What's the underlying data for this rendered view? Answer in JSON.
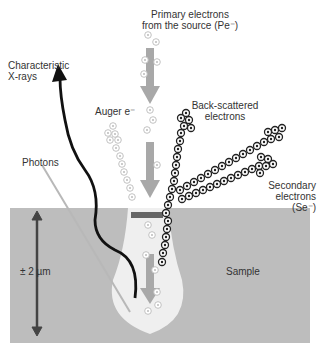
{
  "diagram": {
    "labels": {
      "primary": "Primary electrons",
      "primary2": "from the source (Pe⁻)",
      "xrays": "Characteristic",
      "xrays2": "X-rays",
      "auger": "Auger e⁻",
      "backscattered": "Back-scattered",
      "backscattered2": "electrons",
      "photons": "Photons",
      "secondary": "Secondary",
      "secondary2": "electrons (Se⁻)",
      "depth": "± 2 µm",
      "sample": "Sample"
    },
    "colors": {
      "sample": "#bdbdbd",
      "volume": "#efefef",
      "arrow": "#a8a8a8",
      "xray": "#111111",
      "photon": "#b8b8b8",
      "depth_arrow": "#444444"
    }
  }
}
